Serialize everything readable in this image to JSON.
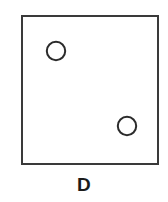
{
  "figure": {
    "panel_label": "D",
    "background_color": "#ffffff",
    "stroke_color": "#3a3a3a",
    "label_color": "#1b1b1b",
    "container": {
      "shape_name": "square",
      "x": 22,
      "y": 16,
      "width": 136,
      "height": 148,
      "stroke_width": 2,
      "fill": "none"
    },
    "items": [
      {
        "shape_name": "circle",
        "id": "circle-top-left",
        "cx": 56,
        "cy": 51,
        "r": 9.2,
        "stroke_width": 2,
        "fill": "none"
      },
      {
        "shape_name": "circle",
        "id": "circle-bottom-right",
        "cx": 127,
        "cy": 126,
        "r": 9.2,
        "stroke_width": 2,
        "fill": "none"
      }
    ]
  },
  "chart_data": {
    "type": "scatter",
    "title": "D",
    "xlabel": "",
    "ylabel": "",
    "xlim": [
      22,
      158
    ],
    "ylim": [
      16,
      164
    ],
    "grid": false,
    "legend": null,
    "series": [
      {
        "name": "open circles",
        "marker": "open-circle",
        "marker_size": 19,
        "count": 2,
        "x": [
          56,
          127
        ],
        "y": [
          51,
          126
        ]
      }
    ],
    "annotations": [
      {
        "text": "D",
        "x": 89,
        "y": 190,
        "role": "panel-label"
      }
    ]
  }
}
